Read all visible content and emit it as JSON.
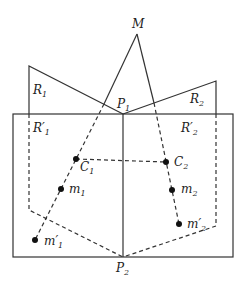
{
  "diagram": {
    "labels": {
      "M": "M",
      "R1": "R",
      "R1_sub": "1",
      "R2": "R",
      "R2_sub": "2",
      "R1p": "R′",
      "R1p_sub": "1",
      "R2p": "R′",
      "R2p_sub": "2",
      "P1": "P",
      "P1_sub": "1",
      "P2": "P",
      "P2_sub": "2",
      "C1": "C",
      "C1_sub": "1",
      "C2": "C",
      "C2_sub": "2",
      "m1": "m",
      "m1_sub": "1",
      "m2": "m",
      "m2_sub": "2",
      "m1p": "m′",
      "m1p_sub": "1",
      "m2p": "m′",
      "m2p_sub": "2"
    },
    "points": {
      "M": [
        137,
        34
      ],
      "P1": [
        123,
        114
      ],
      "P2": [
        123,
        257
      ],
      "R1_corner": [
        29,
        66
      ],
      "R2_corner": [
        216,
        81
      ],
      "C1": [
        76,
        159
      ],
      "C2": [
        166,
        162
      ],
      "m1": [
        61,
        189
      ],
      "m2": [
        172,
        190
      ],
      "m1p": [
        35,
        240
      ],
      "m2p": [
        179,
        224
      ]
    },
    "stroke_color": "#333333"
  }
}
